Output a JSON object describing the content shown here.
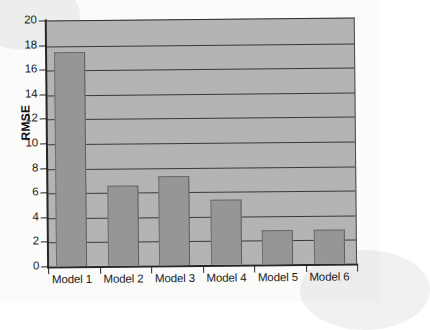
{
  "chart_data": {
    "type": "bar",
    "title": "",
    "xlabel": "",
    "ylabel": "RMSE",
    "categories": [
      "Model 1",
      "Model 2",
      "Model 3",
      "Model 4",
      "Model 5",
      "Model 6"
    ],
    "values": [
      17.4,
      6.5,
      7.2,
      5.3,
      2.8,
      2.8
    ],
    "ylim": [
      0,
      20
    ],
    "yticks": [
      0,
      2,
      4,
      6,
      8,
      10,
      12,
      14,
      16,
      18,
      20
    ],
    "ytick_labels": [
      "0",
      "2",
      "4",
      "6",
      "8",
      "10",
      "12",
      "14",
      "16",
      "18",
      "20"
    ],
    "grid": true,
    "grid_axis": "y",
    "legend": false,
    "series": [
      {
        "name": "RMSE",
        "values": [
          17.4,
          6.5,
          7.2,
          5.3,
          2.8,
          2.8
        ]
      }
    ],
    "colors": {
      "bar_fill": "#969696",
      "bar_edge": "#6a6a6a",
      "plot_background": "#b4b4b4",
      "gridline": "#3a3a3a",
      "axis": "#262626",
      "text": "#1a1a1a",
      "page_background": "#fbfbfa"
    }
  }
}
